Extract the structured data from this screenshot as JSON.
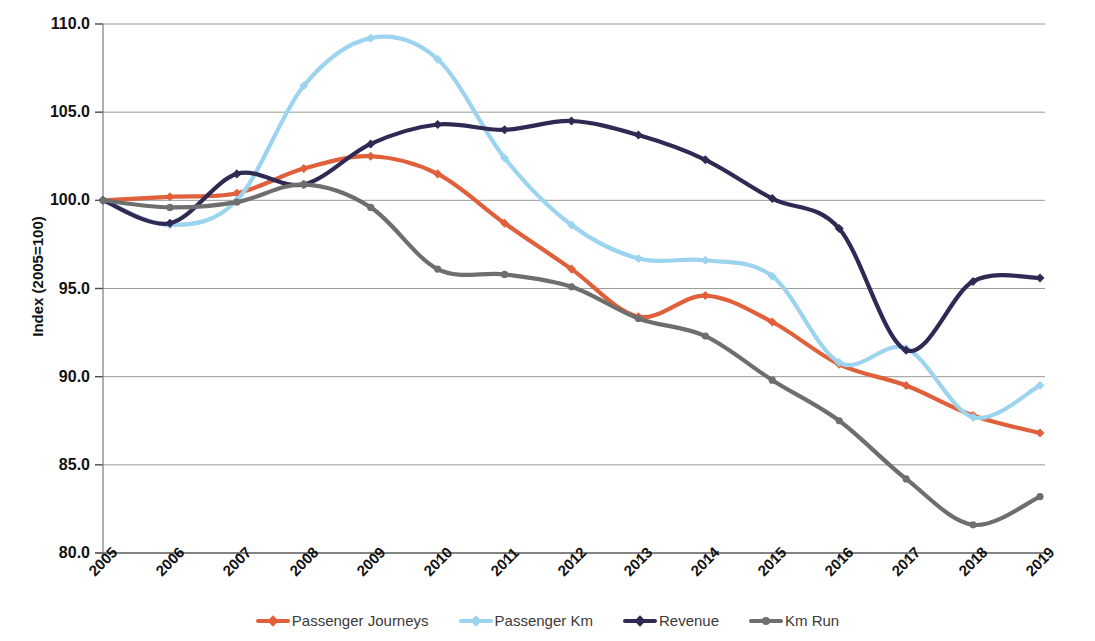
{
  "chart_data": {
    "type": "line",
    "title": "",
    "xlabel": "",
    "ylabel": "Index (2005=100)",
    "ylim": [
      80.0,
      110.0
    ],
    "ytick_labels": [
      "110.0",
      "105.0",
      "100.0",
      "95.0",
      "90.0",
      "85.0",
      "80.0"
    ],
    "ytick_values": [
      110.0,
      105.0,
      100.0,
      95.0,
      90.0,
      85.0,
      80.0
    ],
    "grid": true,
    "legend_position": "bottom",
    "categories": [
      "2005",
      "2006",
      "2007",
      "2008",
      "2009",
      "2010",
      "2011",
      "2012",
      "2013",
      "2014",
      "2015",
      "2016",
      "2017",
      "2018",
      "2019"
    ],
    "x": [
      2005,
      2006,
      2007,
      2008,
      2009,
      2010,
      2011,
      2012,
      2013,
      2014,
      2015,
      2016,
      2017,
      2018,
      2019
    ],
    "series": [
      {
        "name": "Passenger Journeys",
        "color": "#E0603C",
        "marker": "diamond",
        "values": [
          100.0,
          100.2,
          100.4,
          101.8,
          102.5,
          101.5,
          98.7,
          96.1,
          93.4,
          94.6,
          93.1,
          90.7,
          89.5,
          87.8,
          86.8
        ]
      },
      {
        "name": "Passenger Km",
        "color": "#9CD4F0",
        "marker": "diamond",
        "values": [
          100.0,
          98.6,
          100.0,
          106.5,
          109.2,
          108.0,
          102.4,
          98.6,
          96.7,
          96.6,
          95.7,
          90.8,
          91.6,
          87.7,
          89.5
        ]
      },
      {
        "name": "Revenue",
        "color": "#2E2A54",
        "marker": "diamond",
        "values": [
          100.0,
          98.7,
          101.5,
          100.9,
          103.2,
          104.3,
          104.0,
          104.5,
          103.7,
          102.3,
          100.1,
          98.4,
          91.5,
          95.4,
          95.6
        ]
      },
      {
        "name": "Km Run",
        "color": "#6E6E6E",
        "marker": "circle",
        "values": [
          100.0,
          99.6,
          99.9,
          100.9,
          99.6,
          96.1,
          95.8,
          95.1,
          93.3,
          92.3,
          89.8,
          87.5,
          84.2,
          81.6,
          83.2
        ]
      }
    ]
  },
  "legend": {
    "items": [
      {
        "label": "Passenger Journeys",
        "color": "#E0603C"
      },
      {
        "label": "Passenger Km",
        "color": "#9CD4F0"
      },
      {
        "label": "Revenue",
        "color": "#2E2A54"
      },
      {
        "label": "Km Run",
        "color": "#6E6E6E"
      }
    ]
  },
  "axes": {
    "y_title": "Index (2005=100)"
  }
}
